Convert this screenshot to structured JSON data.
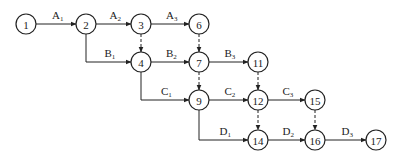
{
  "diagram": {
    "type": "activity-on-arrow network",
    "nodes": [
      {
        "id": "1",
        "label": "1",
        "x": 26,
        "y": 24
      },
      {
        "id": "2",
        "label": "2",
        "x": 86,
        "y": 24
      },
      {
        "id": "3",
        "label": "3",
        "x": 141,
        "y": 24
      },
      {
        "id": "6",
        "label": "6",
        "x": 199,
        "y": 24
      },
      {
        "id": "4",
        "label": "4",
        "x": 141,
        "y": 62
      },
      {
        "id": "7",
        "label": "7",
        "x": 199,
        "y": 62
      },
      {
        "id": "11",
        "label": "11",
        "x": 258,
        "y": 62
      },
      {
        "id": "9",
        "label": "9",
        "x": 199,
        "y": 100
      },
      {
        "id": "12",
        "label": "12",
        "x": 258,
        "y": 100
      },
      {
        "id": "15",
        "label": "15",
        "x": 315,
        "y": 100
      },
      {
        "id": "14",
        "label": "14",
        "x": 258,
        "y": 140
      },
      {
        "id": "16",
        "label": "16",
        "x": 315,
        "y": 140
      },
      {
        "id": "17",
        "label": "17",
        "x": 376,
        "y": 140
      }
    ],
    "activities": [
      {
        "from": "1",
        "to": "2",
        "letter": "A",
        "sub": "1"
      },
      {
        "from": "2",
        "to": "3",
        "letter": "A",
        "sub": "2"
      },
      {
        "from": "3",
        "to": "6",
        "letter": "A",
        "sub": "3"
      },
      {
        "from": "2",
        "to": "4",
        "letter": "B",
        "sub": "1"
      },
      {
        "from": "4",
        "to": "7",
        "letter": "B",
        "sub": "2"
      },
      {
        "from": "7",
        "to": "11",
        "letter": "B",
        "sub": "3"
      },
      {
        "from": "4",
        "to": "9",
        "letter": "C",
        "sub": "1"
      },
      {
        "from": "9",
        "to": "12",
        "letter": "C",
        "sub": "2"
      },
      {
        "from": "12",
        "to": "15",
        "letter": "C",
        "sub": "3"
      },
      {
        "from": "9",
        "to": "14",
        "letter": "D",
        "sub": "1"
      },
      {
        "from": "14",
        "to": "16",
        "letter": "D",
        "sub": "2"
      },
      {
        "from": "16",
        "to": "17",
        "letter": "D",
        "sub": "3"
      }
    ],
    "dummy_activities": [
      {
        "from": "3",
        "to": "4"
      },
      {
        "from": "6",
        "to": "7"
      },
      {
        "from": "7",
        "to": "9"
      },
      {
        "from": "11",
        "to": "12"
      },
      {
        "from": "12",
        "to": "14"
      },
      {
        "from": "15",
        "to": "16"
      }
    ]
  }
}
